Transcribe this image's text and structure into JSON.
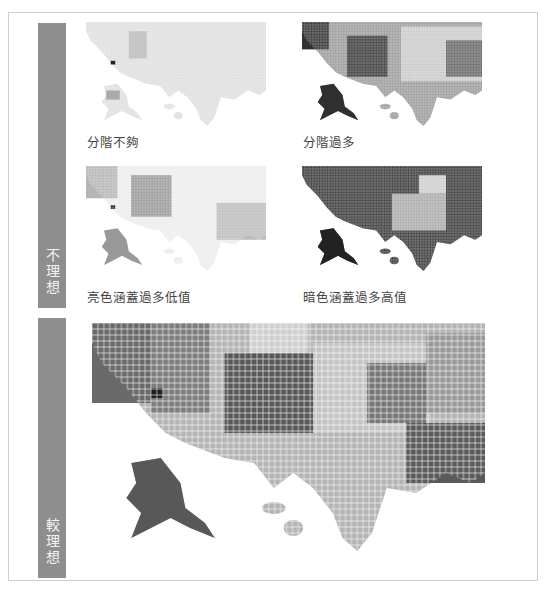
{
  "sections": [
    {
      "label": "不理想"
    },
    {
      "label": "較理想"
    }
  ],
  "panels": [
    {
      "caption": "分階不夠",
      "tone": "light"
    },
    {
      "caption": "分階過多",
      "tone": "dark"
    },
    {
      "caption": "亮色涵蓋過多低值",
      "tone": "lightish"
    },
    {
      "caption": "暗色涵蓋過多高值",
      "tone": "verydark"
    }
  ],
  "colors": {
    "sidebar": "#8e8e8e",
    "border": "#cfcfcf",
    "caption": "#444444"
  }
}
